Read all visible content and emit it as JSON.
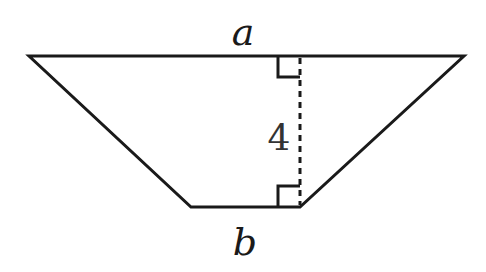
{
  "diagram": {
    "type": "trapezoid",
    "labels": {
      "top_base": "a",
      "bottom_base": "b",
      "height": "4"
    },
    "colors": {
      "stroke": "#1a1a1a",
      "background": "#ffffff"
    }
  }
}
